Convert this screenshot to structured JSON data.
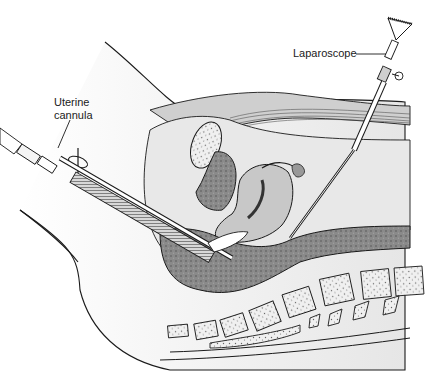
{
  "figure": {
    "type": "medical illustration",
    "style": "grayscale line drawing",
    "colors": {
      "background": "#ffffff",
      "line": "#1a1a1a",
      "tissue_light": "#e4e4e4",
      "tissue_mid": "#b8b8b8",
      "tissue_dark": "#7a7a7a",
      "bone": "#f2f2f2",
      "instrument": "#f8f8f8"
    }
  },
  "labels": {
    "uterine_cannula_line1": "Uterine",
    "uterine_cannula_line2": "cannula",
    "laparoscope": "Laparoscope"
  },
  "structures": [
    {
      "name": "uterine-cannula",
      "shown": true
    },
    {
      "name": "laparoscope",
      "shown": true
    },
    {
      "name": "uterus",
      "shown": true
    },
    {
      "name": "bladder",
      "shown": true
    },
    {
      "name": "pubic-symphysis",
      "shown": true
    },
    {
      "name": "rectum",
      "shown": true
    },
    {
      "name": "sacrum-vertebrae",
      "shown": true
    },
    {
      "name": "fallopian-tube-fimbriae",
      "shown": true
    },
    {
      "name": "abdominal-wall-muscle",
      "shown": true
    }
  ]
}
